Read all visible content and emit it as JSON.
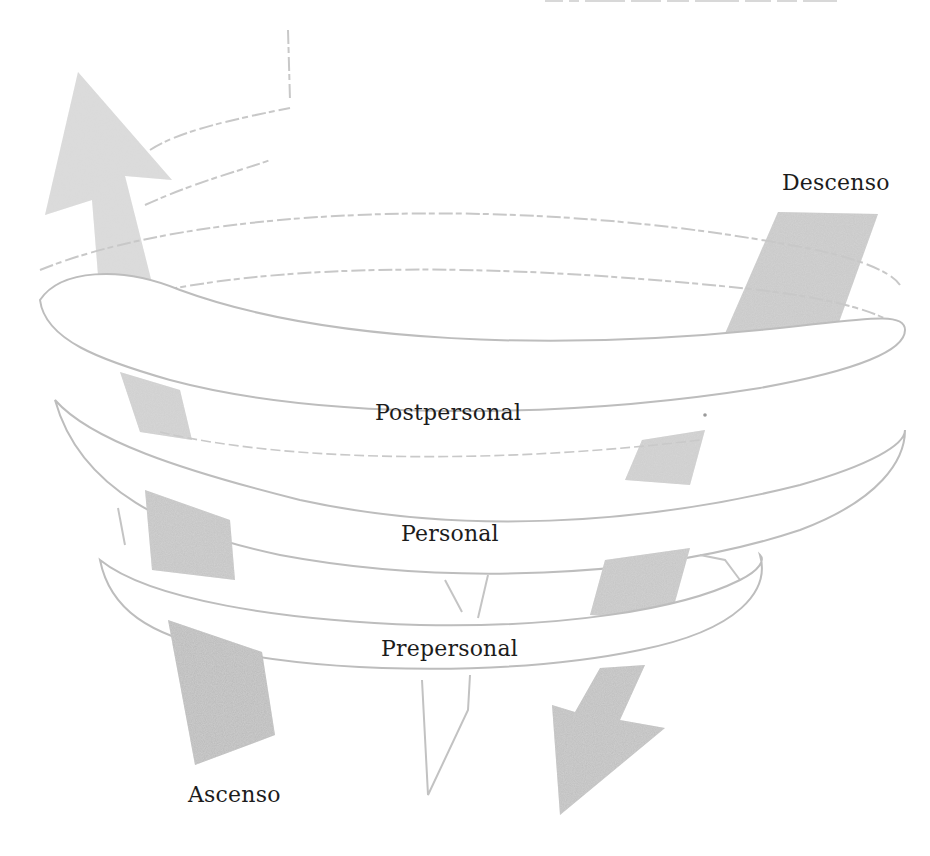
{
  "diagram": {
    "type": "spiral-diagram",
    "top_text_fragment": "",
    "labels": {
      "descent": "Descenso",
      "ascent": "Ascenso",
      "level_top": "Postpersonal",
      "level_middle": "Personal",
      "level_bottom": "Prepersonal"
    },
    "levels": [
      {
        "name": "Postpersonal",
        "order": 3
      },
      {
        "name": "Personal",
        "order": 2
      },
      {
        "name": "Prepersonal",
        "order": 1
      }
    ],
    "arrows": [
      {
        "name": "Ascenso",
        "direction": "up",
        "side": "left"
      },
      {
        "name": "Descenso",
        "direction": "down",
        "side": "right"
      }
    ],
    "colors": {
      "arrow_fill": "#bdbdbd",
      "ribbon_fill": "#ffffff",
      "ribbon_stroke": "#b5b5b5",
      "text": "#1c1c1c",
      "background": "#ffffff"
    }
  }
}
